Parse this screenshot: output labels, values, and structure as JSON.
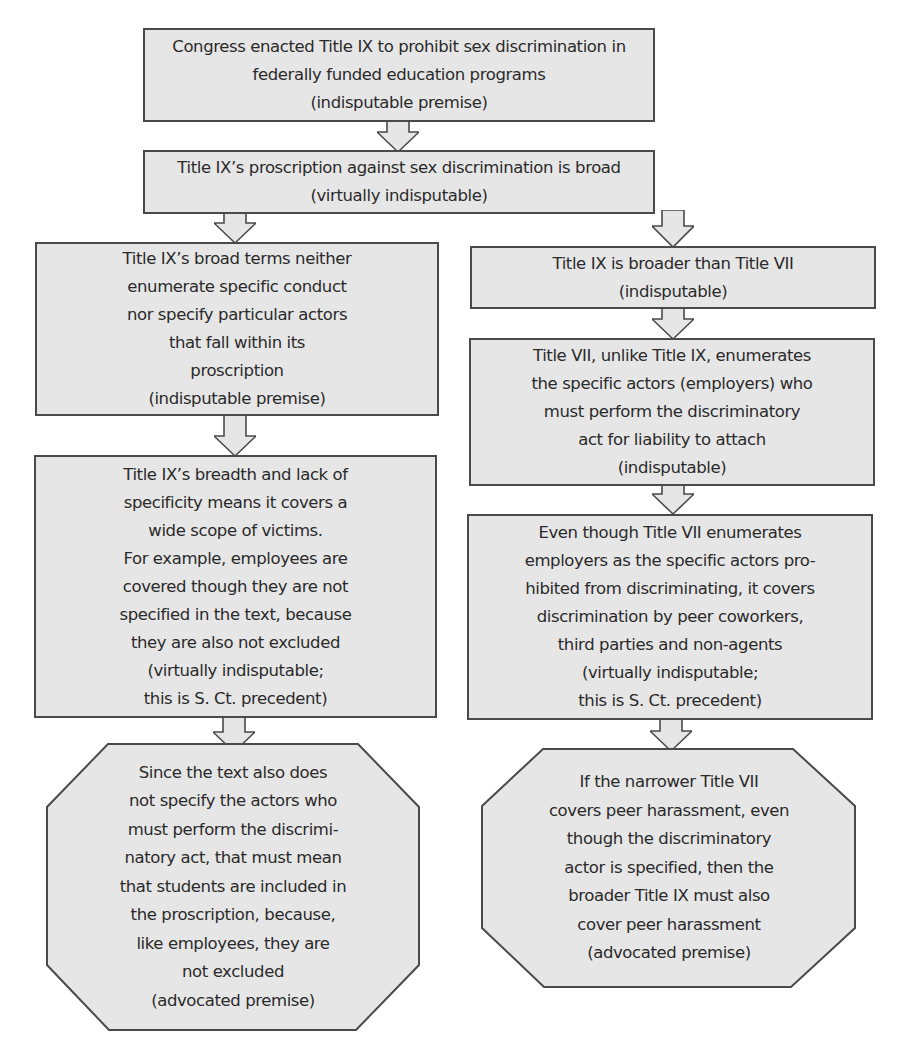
{
  "diagram": {
    "type": "argument-flowchart",
    "colors": {
      "box_fill": "#e6e6e6",
      "box_border": "#4a4a4a",
      "text": "#2a2a2a",
      "background": "#ffffff"
    },
    "nodes": [
      {
        "id": "n1",
        "shape": "rectangle",
        "text": "Congress enacted Title IX to prohibit sex discrimination in\nfederally funded education programs\n(indisputable premise)"
      },
      {
        "id": "n2",
        "shape": "rectangle",
        "text": "Title IX’s proscription against sex discrimination is broad\n(virtually indisputable)"
      },
      {
        "id": "n3_left",
        "shape": "rectangle",
        "text": "Title IX’s broad terms neither\nenumerate specific conduct\nnor specify particular actors\nthat fall within its\nproscription\n(indisputable premise)"
      },
      {
        "id": "n4_left",
        "shape": "rectangle",
        "text": "Title IX’s breadth and lack of\nspecificity means it covers a\nwide scope of victims.\nFor example, employees are\ncovered though they are not\nspecified in the text, because\nthey are also not excluded\n(virtually indisputable;\nthis is S. Ct. precedent)"
      },
      {
        "id": "n5_left",
        "shape": "octagon",
        "text": "Since the text also does\nnot specify the actors who\nmust perform the discrimi-\nnatory act, that must mean\nthat students are included in\nthe proscription, because,\nlike employees, they are\nnot excluded\n(advocated premise)"
      },
      {
        "id": "n3_right",
        "shape": "rectangle",
        "text": "Title IX is broader than Title VII\n(indisputable)"
      },
      {
        "id": "n4_right",
        "shape": "rectangle",
        "text": "Title VII, unlike Title IX, enumerates\nthe specific actors (employers) who\nmust perform the discriminatory\nact for liability to attach\n(indisputable)"
      },
      {
        "id": "n5_right",
        "shape": "rectangle",
        "text": "Even though Title VII enumerates\nemployers as the specific actors pro-\nhibited from discriminating, it covers\ndiscrimination by peer coworkers,\nthird parties and non-agents\n(virtually indisputable;\nthis is S. Ct. precedent)"
      },
      {
        "id": "n6_right",
        "shape": "octagon",
        "text": "If the narrower Title VII\ncovers peer harassment, even\nthough the discriminatory\nactor is specified, then the\nbroader Title IX must also\ncover peer harassment\n(advocated premise)"
      }
    ],
    "edges": [
      {
        "from": "n1",
        "to": "n2"
      },
      {
        "from": "n2",
        "to": "n3_left"
      },
      {
        "from": "n2",
        "to": "n3_right"
      },
      {
        "from": "n3_left",
        "to": "n4_left"
      },
      {
        "from": "n4_left",
        "to": "n5_left"
      },
      {
        "from": "n3_right",
        "to": "n4_right"
      },
      {
        "from": "n4_right",
        "to": "n5_right"
      },
      {
        "from": "n5_right",
        "to": "n6_right"
      }
    ]
  }
}
